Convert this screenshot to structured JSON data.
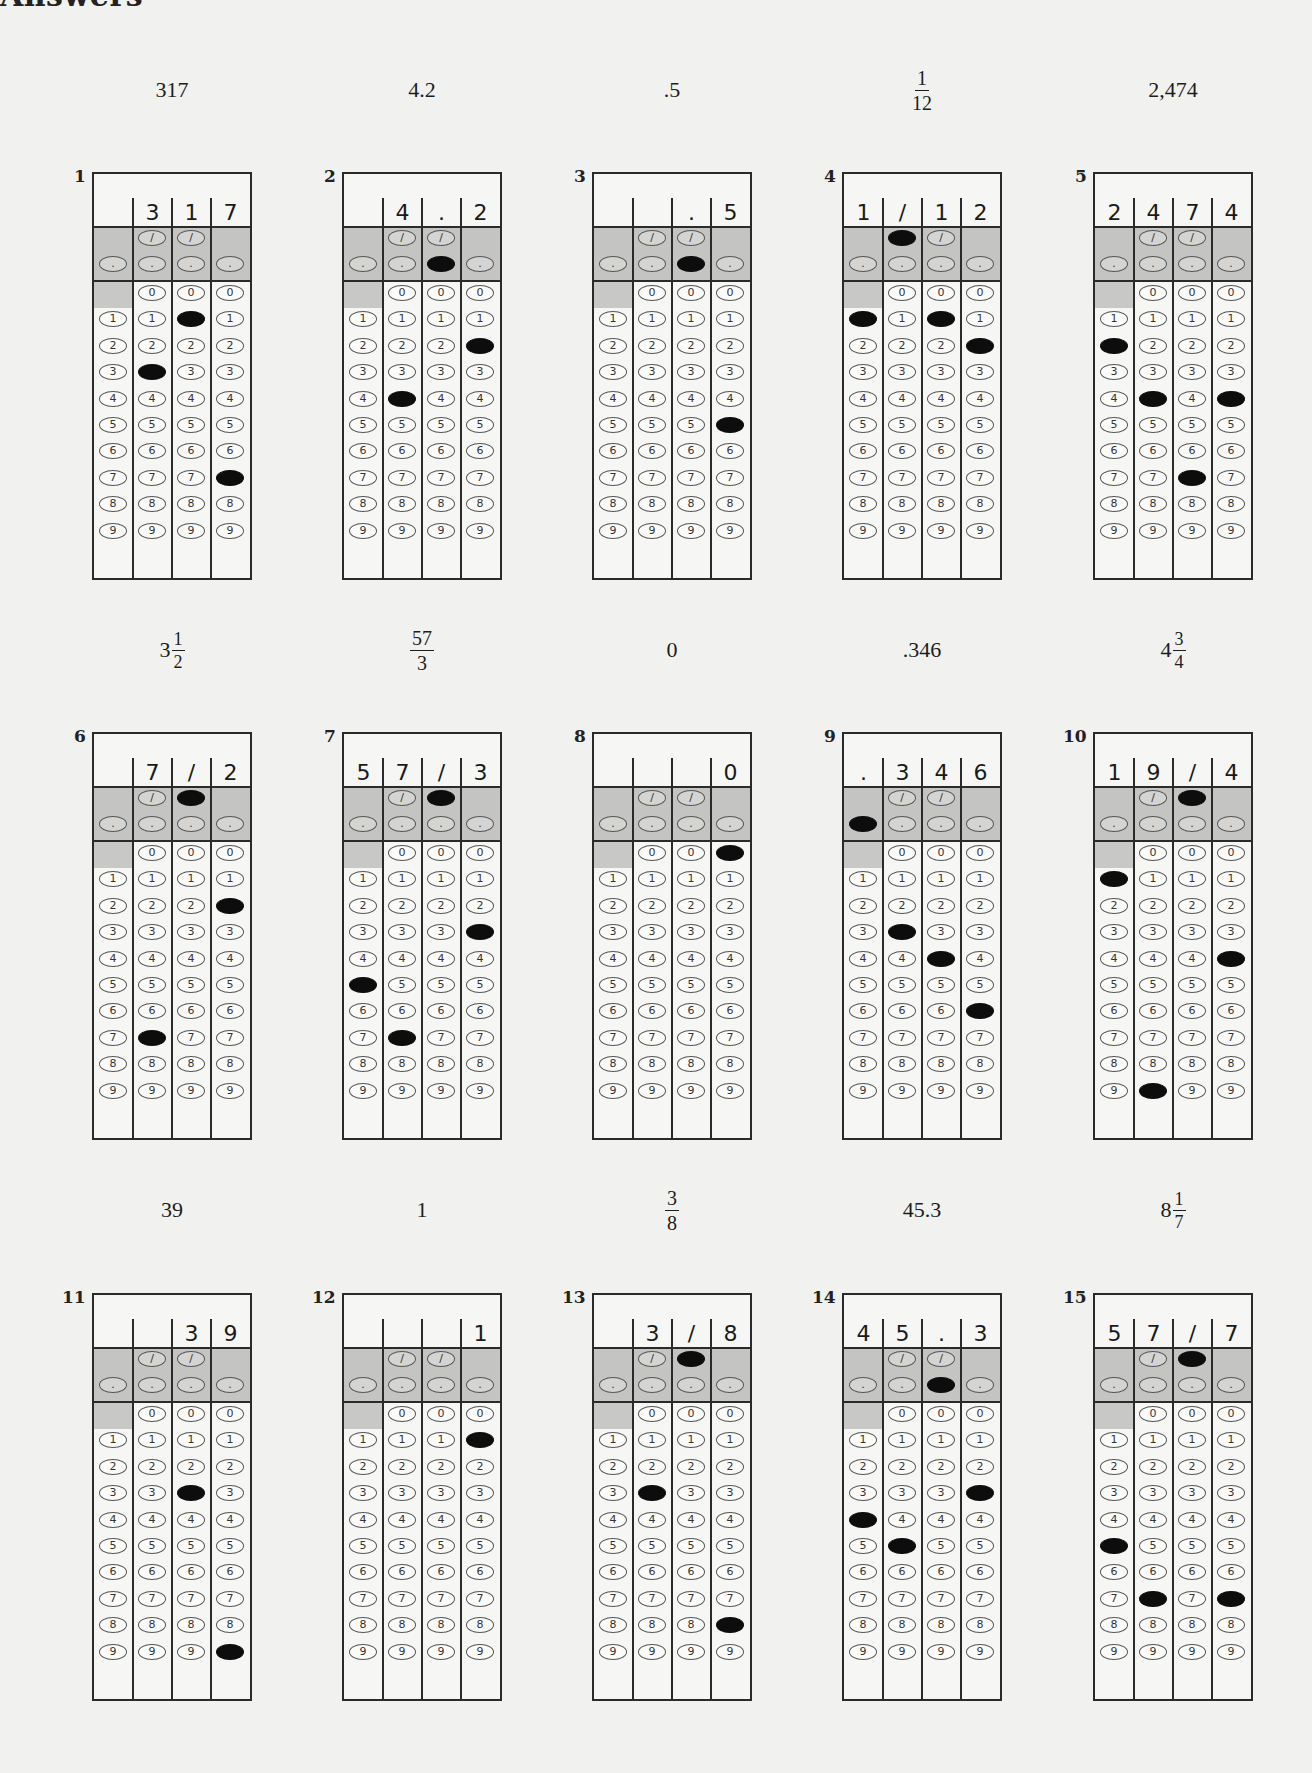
{
  "page": {
    "heading": "Answers"
  },
  "answers": [
    {
      "number": "1",
      "label": {
        "type": "text",
        "text": "317"
      },
      "written": [
        "",
        "3",
        "1",
        "7"
      ],
      "slash": [
        false,
        false
      ],
      "decimal": [
        false,
        false,
        false,
        false
      ],
      "digits": [
        null,
        3,
        1,
        7
      ]
    },
    {
      "number": "2",
      "label": {
        "type": "text",
        "text": "4.2"
      },
      "written": [
        "",
        "4",
        ".",
        "2"
      ],
      "slash": [
        false,
        false
      ],
      "decimal": [
        false,
        false,
        true,
        false
      ],
      "digits": [
        null,
        4,
        null,
        2
      ]
    },
    {
      "number": "3",
      "label": {
        "type": "text",
        "text": ".5"
      },
      "written": [
        "",
        "",
        ".",
        "5"
      ],
      "slash": [
        false,
        false
      ],
      "decimal": [
        false,
        false,
        true,
        false
      ],
      "digits": [
        null,
        null,
        null,
        5
      ]
    },
    {
      "number": "4",
      "label": {
        "type": "frac",
        "whole": "",
        "num": "1",
        "den": "12"
      },
      "written": [
        "1",
        "/",
        "1",
        "2"
      ],
      "slash": [
        true,
        false
      ],
      "decimal": [
        false,
        false,
        false,
        false
      ],
      "digits": [
        1,
        null,
        1,
        2
      ]
    },
    {
      "number": "5",
      "label": {
        "type": "text",
        "text": "2,474"
      },
      "written": [
        "2",
        "4",
        "7",
        "4"
      ],
      "slash": [
        false,
        false
      ],
      "decimal": [
        false,
        false,
        false,
        false
      ],
      "digits": [
        2,
        4,
        7,
        4
      ]
    },
    {
      "number": "6",
      "label": {
        "type": "frac",
        "whole": "3",
        "num": "1",
        "den": "2"
      },
      "written": [
        "",
        "7",
        "/",
        "2"
      ],
      "slash": [
        false,
        true
      ],
      "decimal": [
        false,
        false,
        false,
        false
      ],
      "digits": [
        null,
        7,
        null,
        2
      ]
    },
    {
      "number": "7",
      "label": {
        "type": "frac",
        "whole": "",
        "num": "57",
        "den": "3"
      },
      "written": [
        "5",
        "7",
        "/",
        "3"
      ],
      "slash": [
        false,
        true
      ],
      "decimal": [
        false,
        false,
        false,
        false
      ],
      "digits": [
        5,
        7,
        null,
        3
      ]
    },
    {
      "number": "8",
      "label": {
        "type": "text",
        "text": "0"
      },
      "written": [
        "",
        "",
        "",
        "0"
      ],
      "slash": [
        false,
        false
      ],
      "decimal": [
        false,
        false,
        false,
        false
      ],
      "digits": [
        null,
        null,
        null,
        0
      ]
    },
    {
      "number": "9",
      "label": {
        "type": "text",
        "text": ".346"
      },
      "written": [
        ".",
        "3",
        "4",
        "6"
      ],
      "slash": [
        false,
        false
      ],
      "decimal": [
        true,
        false,
        false,
        false
      ],
      "digits": [
        null,
        3,
        4,
        6
      ]
    },
    {
      "number": "10",
      "label": {
        "type": "frac",
        "whole": "4",
        "num": "3",
        "den": "4"
      },
      "written": [
        "1",
        "9",
        "/",
        "4"
      ],
      "slash": [
        false,
        true
      ],
      "decimal": [
        false,
        false,
        false,
        false
      ],
      "digits": [
        1,
        9,
        null,
        4
      ]
    },
    {
      "number": "11",
      "label": {
        "type": "text",
        "text": "39"
      },
      "written": [
        "",
        "",
        "3",
        "9"
      ],
      "slash": [
        false,
        false
      ],
      "decimal": [
        false,
        false,
        false,
        false
      ],
      "digits": [
        null,
        null,
        3,
        9
      ]
    },
    {
      "number": "12",
      "label": {
        "type": "text",
        "text": "1"
      },
      "written": [
        "",
        "",
        "",
        "1"
      ],
      "slash": [
        false,
        false
      ],
      "decimal": [
        false,
        false,
        false,
        false
      ],
      "digits": [
        null,
        null,
        null,
        1
      ]
    },
    {
      "number": "13",
      "label": {
        "type": "frac",
        "whole": "",
        "num": "3",
        "den": "8"
      },
      "written": [
        "",
        "3",
        "/",
        "8"
      ],
      "slash": [
        false,
        true
      ],
      "decimal": [
        false,
        false,
        false,
        false
      ],
      "digits": [
        null,
        3,
        null,
        8
      ]
    },
    {
      "number": "14",
      "label": {
        "type": "text",
        "text": "45.3"
      },
      "written": [
        "4",
        "5",
        ".",
        "3"
      ],
      "slash": [
        false,
        false
      ],
      "decimal": [
        false,
        false,
        true,
        false
      ],
      "digits": [
        4,
        5,
        null,
        3
      ]
    },
    {
      "number": "15",
      "label": {
        "type": "frac",
        "whole": "8",
        "num": "1",
        "den": "7"
      },
      "written": [
        "5",
        "7",
        "/",
        "7"
      ],
      "slash": [
        false,
        true
      ],
      "decimal": [
        false,
        false,
        false,
        false
      ],
      "digits": [
        5,
        7,
        null,
        7
      ]
    }
  ],
  "grid_symbols": {
    "slash": "/",
    "decimal": ".",
    "digits": [
      "0",
      "1",
      "2",
      "3",
      "4",
      "5",
      "6",
      "7",
      "8",
      "9"
    ]
  },
  "colors": {
    "background": "#f1f1ef",
    "grid_border": "#2a2a2a",
    "shaded_band": "#c4c4c2",
    "filled_bubble": "#0d0d0d"
  }
}
